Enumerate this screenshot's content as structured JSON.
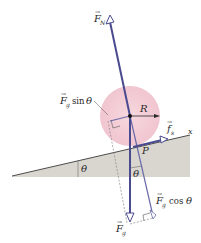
{
  "diagram": {
    "type": "free-body diagram of a ball rolling on an incline",
    "colors": {
      "force_vector": "#5a5a9a",
      "ball_fill": "#f2c6d0",
      "incline_fill": "#d9d6d0",
      "incline_edge": "#3a3a3a",
      "dashed": "#666666",
      "text": "#2a2a2a"
    },
    "labels": {
      "normal_force": {
        "symbol": "F",
        "subscript": "N"
      },
      "gravity_force": {
        "symbol": "F",
        "subscript": "g"
      },
      "gravity_sin": {
        "symbol": "F",
        "subscript": "g",
        "trig": "sin",
        "angle": "θ"
      },
      "gravity_cos": {
        "symbol": "F",
        "subscript": "g",
        "trig": "cos",
        "angle": "θ"
      },
      "static_friction": {
        "symbol": "f",
        "subscript": "s"
      },
      "radius": "R",
      "contact_point": "P",
      "x_axis": "x",
      "incline_angle": "θ",
      "vertical_angle": "θ"
    }
  }
}
